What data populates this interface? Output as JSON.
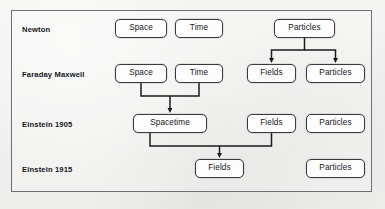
{
  "diagram": {
    "frame": {
      "x": 11,
      "y": 10,
      "width": 361,
      "height": 182
    },
    "colors": {
      "background": "#f2f2f0",
      "frame_border": "#6e6e6e",
      "node_border": "#3a3a3a",
      "node_fill": "#fdfdfd",
      "text": "#16161a",
      "arrow": "#1c1c1c"
    },
    "rows": [
      {
        "label": "Newton",
        "label_x": 22,
        "label_y": 26
      },
      {
        "label": "Faraday Maxwell",
        "label_x": 22,
        "label_y": 71
      },
      {
        "label": "Einstein 1905",
        "label_x": 22,
        "label_y": 121
      },
      {
        "label": "Einstein 1915",
        "label_x": 22,
        "label_y": 166
      }
    ],
    "nodes": [
      {
        "id": "n-space-1",
        "label": "Space",
        "row": 0,
        "x": 115,
        "y": 19,
        "width": 52,
        "height": 19
      },
      {
        "id": "n-time-1",
        "label": "Time",
        "row": 0,
        "x": 175,
        "y": 19,
        "width": 48,
        "height": 19
      },
      {
        "id": "n-particles-1",
        "label": "Particles",
        "row": 0,
        "x": 274,
        "y": 19,
        "width": 61,
        "height": 19
      },
      {
        "id": "n-space-2",
        "label": "Space",
        "row": 1,
        "x": 115,
        "y": 64,
        "width": 52,
        "height": 19
      },
      {
        "id": "n-time-2",
        "label": "Time",
        "row": 1,
        "x": 175,
        "y": 64,
        "width": 48,
        "height": 19
      },
      {
        "id": "n-fields-2",
        "label": "Fields",
        "row": 1,
        "x": 247,
        "y": 64,
        "width": 49,
        "height": 19
      },
      {
        "id": "n-particles-2",
        "label": "Particles",
        "row": 1,
        "x": 306,
        "y": 64,
        "width": 59,
        "height": 19
      },
      {
        "id": "n-spacetime-3",
        "label": "Spacetime",
        "row": 2,
        "x": 133,
        "y": 114,
        "width": 74,
        "height": 19
      },
      {
        "id": "n-fields-3",
        "label": "Fields",
        "row": 2,
        "x": 247,
        "y": 114,
        "width": 49,
        "height": 19
      },
      {
        "id": "n-particles-3",
        "label": "Particles",
        "row": 2,
        "x": 306,
        "y": 114,
        "width": 59,
        "height": 19
      },
      {
        "id": "n-fields-4",
        "label": "Fields",
        "row": 3,
        "x": 195,
        "y": 159,
        "width": 49,
        "height": 19
      },
      {
        "id": "n-particles-4",
        "label": "Particles",
        "row": 3,
        "x": 306,
        "y": 159,
        "width": 59,
        "height": 19
      }
    ],
    "connectors": [
      {
        "id": "c-particles-split",
        "name": "particles-to-fields-and-particles",
        "type": "split",
        "from": "n-particles-1",
        "to": [
          "n-fields-2",
          "n-particles-2"
        ],
        "source_x": 304.5,
        "source_y": 38,
        "bus_y": 50,
        "targets_x": [
          271.5,
          335.5
        ],
        "target_y": 64
      },
      {
        "id": "c-spacetime-merge",
        "name": "space-and-time-to-spacetime",
        "type": "merge",
        "from": [
          "n-space-2",
          "n-time-2"
        ],
        "to": "n-spacetime-3",
        "sources_x": [
          141,
          199
        ],
        "source_y": 83,
        "bus_y": 96,
        "target_x": 170,
        "target_y": 114
      },
      {
        "id": "c-fields-merge",
        "name": "spacetime-and-fields-to-fields",
        "type": "merge",
        "from": [
          "n-spacetime-3",
          "n-fields-3"
        ],
        "to": "n-fields-4",
        "sources_x": [
          150,
          271.5
        ],
        "source_y": 133,
        "bus_y": 146,
        "target_x": 219.5,
        "target_y": 159
      }
    ]
  }
}
